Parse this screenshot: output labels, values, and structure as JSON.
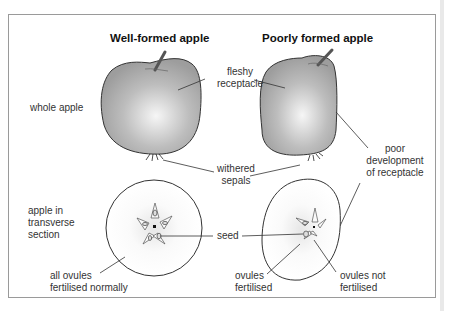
{
  "titles": {
    "left": "Well-formed apple",
    "right": "Poorly formed apple"
  },
  "row_labels": {
    "whole": "whole apple",
    "section": "apple in\ntransverse\nsection"
  },
  "annotations": {
    "fleshy_receptacle": "fleshy\nreceptacle",
    "withered_sepals": "withered\nsepals",
    "poor_development": "poor\ndevelopment\nof receptacle",
    "seed": "seed",
    "all_ovules": "all ovules\nfertilised normally",
    "ovules_fertilised": "ovules\nfertilised",
    "ovules_not_fertilised": "ovules not\nfertilised"
  },
  "colors": {
    "apple_fill": "#a9a9a9",
    "apple_highlight": "#f4f4f4",
    "outline": "#333333",
    "frame": "#9a9a9a"
  }
}
